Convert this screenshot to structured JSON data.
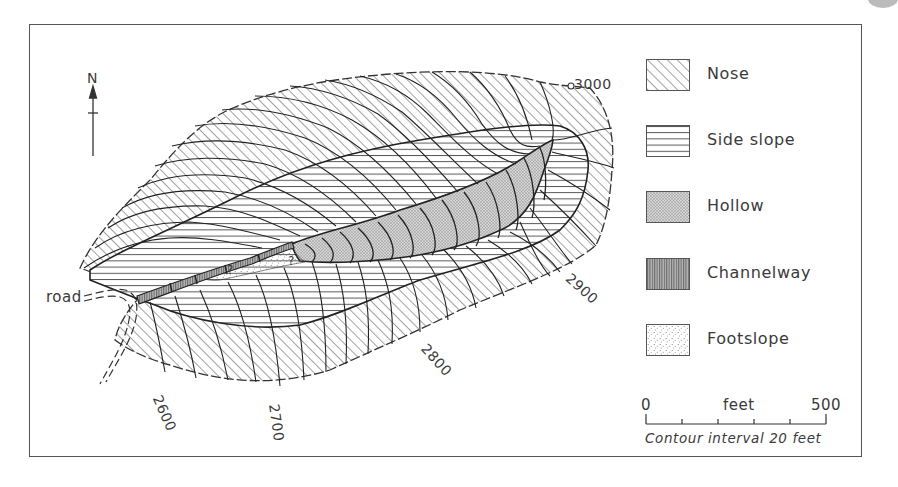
{
  "map": {
    "north_label": "N",
    "road_label": "road",
    "uncertain_marker": "?",
    "contour_labels": [
      {
        "text": "3000",
        "x": 574,
        "y": 78,
        "rotate": 0
      },
      {
        "text": "2900",
        "x": 568,
        "y": 276,
        "rotate": 42
      },
      {
        "text": "2800",
        "x": 426,
        "y": 344,
        "rotate": 48
      },
      {
        "text": "2700",
        "x": 271,
        "y": 397,
        "rotate": 82
      },
      {
        "text": "2600",
        "x": 154,
        "y": 392,
        "rotate": 66
      }
    ]
  },
  "legend": {
    "items": [
      {
        "key": "nose",
        "label": "Nose",
        "pattern": "diagonal-hatch"
      },
      {
        "key": "side_slope",
        "label": "Side slope",
        "pattern": "horizontal-lines"
      },
      {
        "key": "hollow",
        "label": "Hollow",
        "pattern": "fine-stipple"
      },
      {
        "key": "channelway",
        "label": "Channelway",
        "pattern": "vertical-lines"
      },
      {
        "key": "footslope",
        "label": "Footslope",
        "pattern": "sparse-dots"
      }
    ]
  },
  "scale": {
    "start": "0",
    "unit": "feet",
    "end": "500",
    "caption": "Contour interval 20 feet"
  },
  "colors": {
    "ink": "#3a3a3a",
    "hollow_fill": "#c9c9c9",
    "background": "#ffffff"
  }
}
